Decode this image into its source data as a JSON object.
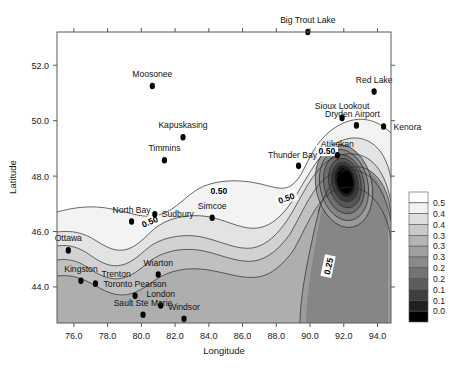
{
  "chart_data": {
    "type": "contour",
    "title": "",
    "xlabel": "Longitude",
    "ylabel": "Latitude",
    "xlim": [
      75.0,
      94.8
    ],
    "ylim": [
      42.7,
      53.2
    ],
    "xticks": [
      "76.0",
      "78.0",
      "80.0",
      "82.0",
      "84.0",
      "86.0",
      "88.0",
      "90.0",
      "92.0",
      "94.0"
    ],
    "xtick_values": [
      76,
      78,
      80,
      82,
      84,
      86,
      88,
      90,
      92,
      94
    ],
    "yticks": [
      "44.0",
      "46.0",
      "48.0",
      "50.0",
      "52.0"
    ],
    "ytick_values": [
      44,
      46,
      48,
      50,
      52
    ],
    "grid": false,
    "legend_position": "right",
    "contour_labels": [
      {
        "text": "0.50",
        "x": 80.5,
        "y": 46.35,
        "rotation": -22
      },
      {
        "text": "0.50",
        "x": 84.6,
        "y": 47.45,
        "rotation": 0
      },
      {
        "text": "0.50",
        "x": 88.6,
        "y": 47.2,
        "rotation": -20
      },
      {
        "text": "0.50",
        "x": 91.0,
        "y": 48.9,
        "rotation": 0
      },
      {
        "text": "0.25",
        "x": 91.1,
        "y": 44.75,
        "rotation": -78
      }
    ],
    "colorbar": {
      "labels": [
        "0.5",
        "0.4",
        "0.4",
        "0.3",
        "0.3",
        "0.3",
        "0.2",
        "0.2",
        "0.1",
        "0.1",
        "0.0"
      ],
      "swatches": [
        "#ffffff",
        "#f2f2f2",
        "#dedede",
        "#c9c9c9",
        "#b4b4b4",
        "#9f9f9f",
        "#8a8a8a",
        "#747474",
        "#5d5d5d",
        "#3f3f3f",
        "#202020",
        "#000000"
      ],
      "min": 0.0,
      "max": 0.5
    },
    "stations": [
      {
        "name": "Big Trout Lake",
        "x": 89.87,
        "y": 53.2,
        "label_dx": 0,
        "label_dy": -9,
        "anchor": "middle"
      },
      {
        "name": "Moosonee",
        "x": 80.65,
        "y": 51.25,
        "label_dx": 0,
        "label_dy": -9,
        "anchor": "middle"
      },
      {
        "name": "Red Lake",
        "x": 93.8,
        "y": 51.05,
        "label_dx": 0,
        "label_dy": -9,
        "anchor": "middle"
      },
      {
        "name": "Kapuskasing",
        "x": 82.47,
        "y": 49.4,
        "label_dx": 0,
        "label_dy": -9,
        "anchor": "middle"
      },
      {
        "name": "Sioux Lookout",
        "x": 91.9,
        "y": 50.1,
        "label_dx": 0,
        "label_dy": -9,
        "anchor": "middle"
      },
      {
        "name": "Dryden Airport",
        "x": 92.75,
        "y": 49.83,
        "label_dx": -4,
        "label_dy": -8,
        "anchor": "middle"
      },
      {
        "name": "Kenora",
        "x": 94.36,
        "y": 49.79,
        "label_dx": 10,
        "label_dy": 3,
        "anchor": "start"
      },
      {
        "name": "Timmins",
        "x": 81.37,
        "y": 48.57,
        "label_dx": 0,
        "label_dy": -9,
        "anchor": "middle"
      },
      {
        "name": "Atikokan",
        "x": 91.62,
        "y": 48.75,
        "label_dx": 0,
        "label_dy": -8,
        "anchor": "middle"
      },
      {
        "name": "Thunder Bay",
        "x": 89.32,
        "y": 48.37,
        "label_dx": -6,
        "label_dy": -8,
        "anchor": "middle"
      },
      {
        "name": "North Bay",
        "x": 79.42,
        "y": 46.36,
        "label_dx": 0,
        "label_dy": -9,
        "anchor": "middle"
      },
      {
        "name": "Sudbury",
        "x": 80.8,
        "y": 46.62,
        "label_dx": 7,
        "label_dy": 3,
        "anchor": "start"
      },
      {
        "name": "Simcoe",
        "x": 84.2,
        "y": 46.5,
        "label_dx": 0,
        "label_dy": -9,
        "anchor": "middle"
      },
      {
        "name": "Ottawa",
        "x": 75.67,
        "y": 45.32,
        "label_dx": 0,
        "label_dy": -9,
        "anchor": "middle"
      },
      {
        "name": "Kingston",
        "x": 76.42,
        "y": 44.22,
        "label_dx": 0,
        "label_dy": -9,
        "anchor": "middle"
      },
      {
        "name": "Trenton",
        "x": 77.28,
        "y": 44.12,
        "label_dx": 6,
        "label_dy": -7,
        "anchor": "start"
      },
      {
        "name": "Wiarton",
        "x": 81.0,
        "y": 44.45,
        "label_dx": 0,
        "label_dy": -9,
        "anchor": "middle"
      },
      {
        "name": "Toronto Pearson",
        "x": 79.63,
        "y": 43.68,
        "label_dx": 0,
        "label_dy": -9,
        "anchor": "middle"
      },
      {
        "name": "London",
        "x": 81.15,
        "y": 43.33,
        "label_dx": 0,
        "label_dy": -9,
        "anchor": "middle"
      },
      {
        "name": "Sault Ste Marie",
        "x": 80.1,
        "y": 43.0,
        "label_dx": 0,
        "label_dy": -9,
        "anchor": "middle"
      },
      {
        "name": "Windsor",
        "x": 82.53,
        "y": 42.85,
        "label_dx": 0,
        "label_dy": -9,
        "anchor": "middle"
      }
    ]
  }
}
